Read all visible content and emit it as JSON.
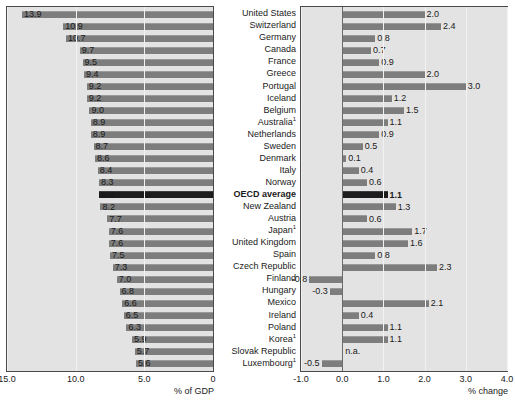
{
  "chart_data": {
    "type": "bar",
    "title": "",
    "categories": [
      "United States",
      "Switzerland",
      "Germany",
      "Canada",
      "France",
      "Greece",
      "Portugal",
      "Iceland",
      "Belgium",
      "Australia¹",
      "Netherlands",
      "Sweden",
      "Denmark",
      "Italy",
      "Norway",
      "OECD average",
      "New Zealand",
      "Austria",
      "Japan¹",
      "United Kingdom",
      "Spain",
      "Czech Republic",
      "Finland",
      "Hungary",
      "Mexico",
      "Ireland",
      "Poland",
      "Korea¹",
      "Slovak Republic",
      "Luxembourg¹"
    ],
    "highlight_category": "OECD average",
    "panels": [
      {
        "id": "left",
        "xlabel": "% of GDP",
        "xlim": [
          15.0,
          0.0
        ],
        "reversed": true,
        "ticks": [
          "15.0",
          "10.0",
          "5.0",
          "0"
        ],
        "tick_values": [
          15.0,
          10.0,
          5.0,
          0.0
        ],
        "values": [
          13.9,
          10.9,
          10.7,
          9.7,
          9.5,
          9.4,
          9.2,
          9.2,
          9.0,
          8.9,
          8.9,
          8.7,
          8.6,
          8.4,
          8.3,
          8.3,
          8.2,
          7.7,
          7.6,
          7.6,
          7.5,
          7.3,
          7.0,
          6.8,
          6.6,
          6.5,
          6.3,
          5.9,
          5.7,
          5.6
        ],
        "labels": [
          "13.9",
          "10.9",
          "10.7",
          "9.7",
          "9.5",
          "9.4",
          "9.2",
          "9.2",
          "9.0",
          "8.9",
          "8.9",
          "8.7",
          "8.6",
          "8.4",
          "8.3",
          "8.3",
          "8.2",
          "7.7",
          "7.6",
          "7.6",
          "7.5",
          "7.3",
          "7.0",
          "6.8",
          "6.6",
          "6.5",
          "6.3",
          "5.9",
          "5.7",
          "5.6"
        ]
      },
      {
        "id": "right",
        "xlabel": "% change",
        "xlim": [
          -1.0,
          4.0
        ],
        "reversed": false,
        "ticks": [
          "-1.0",
          "0.0",
          "1.0",
          "2.0",
          "3.0",
          "4.0"
        ],
        "tick_values": [
          -1.0,
          0.0,
          1.0,
          2.0,
          3.0,
          4.0
        ],
        "values": [
          2.0,
          2.4,
          0.8,
          0.7,
          0.9,
          2.0,
          3.0,
          1.2,
          1.5,
          1.1,
          0.9,
          0.5,
          0.1,
          0.4,
          0.6,
          1.1,
          1.3,
          0.6,
          1.7,
          1.6,
          0.8,
          2.3,
          -0.8,
          -0.3,
          2.1,
          0.4,
          1.1,
          1.1,
          null,
          -0.5
        ],
        "labels": [
          "2.0",
          "2.4",
          "0.8",
          "0.7",
          "0.9",
          "2.0",
          "3.0",
          "1.2",
          "1.5",
          "1.1",
          "0.9",
          "0.5",
          "0.1",
          "0.4",
          "0.6",
          "1.1",
          "1.3",
          "0.6",
          "1.7",
          "1.6",
          "0.8",
          "2.3",
          "-0.8",
          "-0.3",
          "2.1",
          "0.4",
          "1.1",
          "1.1",
          "n.a.",
          "-0.5"
        ]
      }
    ],
    "grid": true,
    "legend": "none",
    "colors": {
      "bar": "#7d7d7d",
      "bar_highlight": "#1c1c1c",
      "panel_background": "#e3e3e3",
      "frame": "#4a4a4a",
      "gridline": "#f2f2f2",
      "text": "#1a1a1a"
    }
  }
}
